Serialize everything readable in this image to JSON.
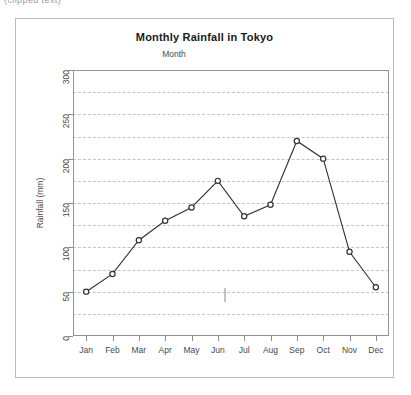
{
  "top_sliver": {
    "text": "(clipped text)"
  },
  "frame": {
    "name": "chart-frame"
  },
  "chart_data": {
    "type": "line",
    "title": "Monthly Rainfall in Tokyo",
    "xlabel": "Month",
    "ylabel": "Rainfall (mm)",
    "categories": [
      "Jan",
      "Feb",
      "Mar",
      "Apr",
      "May",
      "Jun",
      "Jul",
      "Aug",
      "Sep",
      "Oct",
      "Nov",
      "Dec"
    ],
    "values": [
      50,
      70,
      108,
      130,
      145,
      175,
      135,
      148,
      220,
      200,
      95,
      55
    ],
    "ylim": [
      0,
      300
    ],
    "ytick_labels": [
      "0",
      "50",
      "100",
      "150",
      "200",
      "250",
      "300"
    ],
    "ytick_values": [
      0,
      50,
      100,
      150,
      200,
      250,
      300
    ],
    "gridline_values": [
      25,
      50,
      75,
      100,
      125,
      150,
      175,
      200,
      225,
      250,
      275
    ],
    "grid": true,
    "legend": false,
    "marker": "open-circle",
    "line_color": "#333333",
    "marker_fill": "#ffffff",
    "grid_color": "#c3c3cd",
    "axis_color": "#8a8a8a"
  }
}
